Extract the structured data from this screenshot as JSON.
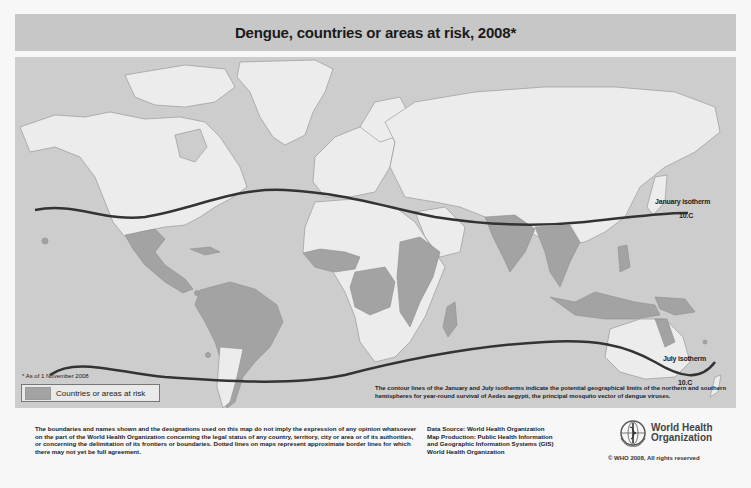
{
  "title": "Dengue, countries or areas at risk, 2008*",
  "map": {
    "colors": {
      "ocean": "#cdcdcd",
      "land": "#ececec",
      "at_risk": "#a3a3a3",
      "border": "#8e8e8e",
      "isotherm": "#333333"
    },
    "isotherms": {
      "january": {
        "label": "January isotherm",
        "value": "10.C"
      },
      "july": {
        "label": "July isotherm",
        "value": "10.C"
      }
    },
    "footnote": "* As of 1 November 2008",
    "legend": {
      "label": "Countries or areas at risk"
    },
    "isotherm_note": "The contour lines of the January and July isotherms indicate the potential geographical limits of the northern and southern hemispheres for year-round survival of Aedes aegypti, the principal mosquito vector of dengue viruses.",
    "at_risk_regions": [
      "Mexico",
      "Central America",
      "Caribbean",
      "South America (northern and central)",
      "West Africa",
      "Central Africa",
      "East Africa",
      "Madagascar",
      "India",
      "Southeast Asia",
      "Indonesia",
      "Philippines",
      "Papua New Guinea",
      "Northern Australia",
      "Pacific islands"
    ]
  },
  "footer": {
    "disclaimer": "The boundaries and names shown and the designations used on this map do not imply the expression of any opinion whatsoever on the part of the World Health Organization concerning the legal status of any country, territory, city or area or of its authorities, or concerning the delimitation of its frontiers or boundaries. Dotted lines on maps represent approximate border lines for which there may not yet be full agreement.",
    "data_source": [
      "Data Source: World Health Organization",
      "Map Production: Public Health Information",
      "and Geographic Information Systems (GIS)",
      "World Health Organization"
    ],
    "who_name_line1": "World Health",
    "who_name_line2": "Organization",
    "copyright": "© WHO 2008, All rights reserved"
  }
}
